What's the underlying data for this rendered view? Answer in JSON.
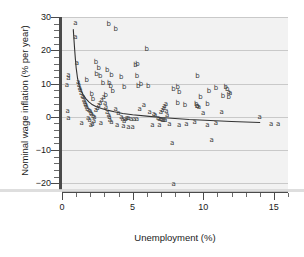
{
  "chart_data": {
    "type": "scatter",
    "title": "",
    "xlabel": "Unemployment (%)",
    "ylabel": "Nominal wage inflation (% per year)",
    "xlim": [
      0,
      16
    ],
    "ylim": [
      -22,
      30
    ],
    "xticks": [
      0,
      5,
      10,
      15
    ],
    "xticklabels": [
      "0",
      "5",
      "10",
      "15"
    ],
    "xtick_minor_step": 1,
    "yticks": [
      30,
      20,
      10,
      0,
      -10,
      -20
    ],
    "yticklabels": [
      "30",
      "20",
      "10",
      "0",
      "−10",
      "−20"
    ],
    "ytick_minor_step": 2,
    "grid": "horizontal",
    "legend": "none",
    "marker_style": "text-letter",
    "series": [
      {
        "name": "a",
        "label": "a",
        "points": [
          [
            0.95,
            28.2
          ],
          [
            0.95,
            24.0
          ],
          [
            1.05,
            16.3
          ],
          [
            0.45,
            12.6
          ],
          [
            0.45,
            11.6
          ],
          [
            0.35,
            9.6
          ],
          [
            1.15,
            10.4
          ],
          [
            1.2,
            9.5
          ],
          [
            1.25,
            8.6
          ],
          [
            1.3,
            8.0
          ],
          [
            1.35,
            7.2
          ],
          [
            1.45,
            6.4
          ],
          [
            1.5,
            5.9
          ],
          [
            1.55,
            5.2
          ],
          [
            1.6,
            4.6
          ],
          [
            1.65,
            4.0
          ],
          [
            1.7,
            3.4
          ],
          [
            1.75,
            2.9
          ],
          [
            1.8,
            2.4
          ],
          [
            1.9,
            2.0
          ],
          [
            2.0,
            1.6
          ],
          [
            2.05,
            1.1
          ],
          [
            2.1,
            0.7
          ],
          [
            2.2,
            0.3
          ],
          [
            2.3,
            0.0
          ],
          [
            2.4,
            1.9
          ],
          [
            2.5,
            2.6
          ],
          [
            2.6,
            3.4
          ],
          [
            2.7,
            4.1
          ],
          [
            2.8,
            5.1
          ],
          [
            2.95,
            6.0
          ],
          [
            3.05,
            4.2
          ],
          [
            3.1,
            2.8
          ],
          [
            3.2,
            1.4
          ],
          [
            3.3,
            0.5
          ],
          [
            3.35,
            -0.2
          ],
          [
            3.4,
            -0.9
          ],
          [
            3.5,
            -1.6
          ],
          [
            2.25,
            -1.4
          ],
          [
            2.15,
            -2.1
          ],
          [
            1.95,
            -1.1
          ],
          [
            1.85,
            -0.5
          ],
          [
            0.4,
            1.8
          ],
          [
            0.45,
            -0.4
          ],
          [
            3.8,
            2.3
          ],
          [
            4.0,
            1.2
          ],
          [
            4.2,
            0.0
          ],
          [
            4.3,
            -0.7
          ],
          [
            4.4,
            -1.3
          ],
          [
            4.5,
            -0.6
          ],
          [
            4.6,
            -0.5
          ],
          [
            4.7,
            -0.5
          ],
          [
            4.9,
            -0.6
          ],
          [
            5.1,
            -0.6
          ],
          [
            5.3,
            -0.6
          ],
          [
            4.35,
            -2.9
          ],
          [
            4.7,
            -3.1
          ],
          [
            5.0,
            -3.0
          ],
          [
            5.5,
            2.2
          ],
          [
            5.8,
            3.4
          ],
          [
            6.2,
            1.4
          ],
          [
            6.5,
            0.9
          ],
          [
            6.6,
            0.4
          ],
          [
            6.8,
            -0.4
          ],
          [
            6.9,
            -0.7
          ],
          [
            7.0,
            -0.8
          ],
          [
            7.1,
            -0.9
          ],
          [
            7.2,
            -1.0
          ],
          [
            7.3,
            -1.1
          ],
          [
            7.0,
            1.3
          ],
          [
            7.1,
            2.0
          ],
          [
            7.2,
            2.6
          ],
          [
            7.25,
            3.2
          ],
          [
            7.35,
            3.7
          ],
          [
            7.4,
            1.8
          ],
          [
            7.45,
            0.6
          ],
          [
            6.4,
            -2.4
          ],
          [
            6.9,
            -2.6
          ],
          [
            7.6,
            -2.3
          ],
          [
            7.8,
            -7.8
          ],
          [
            7.9,
            -20.2
          ],
          [
            8.3,
            -2.4
          ],
          [
            8.8,
            -2.3
          ],
          [
            9.4,
            -1.5
          ],
          [
            9.6,
            3.3
          ],
          [
            9.7,
            2.8
          ],
          [
            10.0,
            1.2
          ],
          [
            10.3,
            -2.6
          ],
          [
            10.6,
            -7.0
          ],
          [
            10.9,
            -1.9
          ],
          [
            11.3,
            1.3
          ],
          [
            11.8,
            7.6
          ],
          [
            11.9,
            7.2
          ],
          [
            14.0,
            -0.2
          ],
          [
            14.8,
            -2.1
          ],
          [
            15.3,
            -2.1
          ],
          [
            3.9,
            -2.4
          ],
          [
            2.05,
            -2.6
          ],
          [
            1.4,
            -1.9
          ],
          [
            2.75,
            -2.0
          ]
        ]
      },
      {
        "name": "b",
        "label": "b",
        "points": [
          [
            3.3,
            28.0
          ],
          [
            3.8,
            26.4
          ],
          [
            6.0,
            20.4
          ],
          [
            2.4,
            16.6
          ],
          [
            2.6,
            14.6
          ],
          [
            2.45,
            13.0
          ],
          [
            2.7,
            12.2
          ],
          [
            3.2,
            14.2
          ],
          [
            3.5,
            12.6
          ],
          [
            3.35,
            10.3
          ],
          [
            3.45,
            9.3
          ],
          [
            5.2,
            15.6
          ],
          [
            5.35,
            15.8
          ],
          [
            5.3,
            12.4
          ],
          [
            5.4,
            9.4
          ],
          [
            5.6,
            9.8
          ],
          [
            6.1,
            9.3
          ],
          [
            9.6,
            12.3
          ],
          [
            7.9,
            8.5
          ],
          [
            8.2,
            9.0
          ],
          [
            8.3,
            7.4
          ],
          [
            10.4,
            7.9
          ],
          [
            10.9,
            8.8
          ],
          [
            11.6,
            8.9
          ],
          [
            11.7,
            8.4
          ],
          [
            9.8,
            6.0
          ],
          [
            11.4,
            6.4
          ],
          [
            11.8,
            6.0
          ],
          [
            8.2,
            4.3
          ],
          [
            8.7,
            3.6
          ],
          [
            9.5,
            4.0
          ],
          [
            9.55,
            3.3
          ],
          [
            10.3,
            3.9
          ],
          [
            2.9,
            10.3
          ],
          [
            4.2,
            12.0
          ],
          [
            3.6,
            7.9
          ],
          [
            4.4,
            8.9
          ],
          [
            3.1,
            6.6
          ],
          [
            2.1,
            6.8
          ],
          [
            2.2,
            5.4
          ],
          [
            1.75,
            11.2
          ]
        ]
      }
    ],
    "fit_curve": {
      "name": "fitted-phillips-curve",
      "description": "downward-sloping convex fitted curve",
      "points": [
        [
          0.8,
          26.2
        ],
        [
          0.85,
          23.0
        ],
        [
          0.9,
          20.0
        ],
        [
          0.95,
          17.2
        ],
        [
          1.0,
          14.8
        ],
        [
          1.1,
          11.6
        ],
        [
          1.2,
          9.6
        ],
        [
          1.35,
          7.8
        ],
        [
          1.5,
          6.6
        ],
        [
          1.7,
          5.4
        ],
        [
          1.9,
          4.5
        ],
        [
          2.1,
          3.8
        ],
        [
          2.4,
          3.1
        ],
        [
          2.8,
          2.5
        ],
        [
          3.2,
          2.0
        ],
        [
          3.7,
          1.5
        ],
        [
          4.3,
          1.0
        ],
        [
          5.0,
          0.6
        ],
        [
          6.0,
          0.2
        ],
        [
          7.0,
          -0.2
        ],
        [
          8.0,
          -0.5
        ],
        [
          9.0,
          -0.8
        ],
        [
          10.5,
          -1.1
        ],
        [
          12.0,
          -1.4
        ],
        [
          14.0,
          -1.7
        ]
      ]
    }
  },
  "axes": {
    "y_title": "Nominal wage inflation (% per year)",
    "x_title": "Unemployment (%)"
  }
}
